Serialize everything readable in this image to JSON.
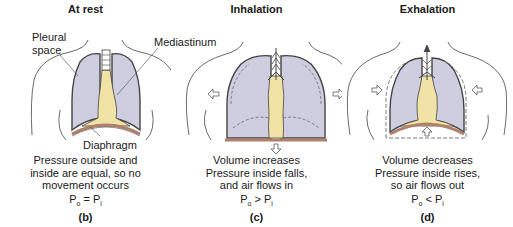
{
  "panels": [
    {
      "title": "At rest",
      "labels": {
        "pleural": "Pleural\nspace",
        "mediastinum": "Mediastinum",
        "diaphragm": "Diaphragm"
      },
      "caption": [
        "Pressure outside and",
        "inside are equal, so no",
        "movement occurs"
      ],
      "equation": {
        "left": "P",
        "left_sub": "o",
        "op": " = ",
        "right": "P",
        "right_sub": "i"
      },
      "letter": "(b)"
    },
    {
      "title": "Inhalation",
      "caption": [
        "Volume increases",
        "Pressure inside falls,",
        "and air flows in"
      ],
      "equation": {
        "left": "P",
        "left_sub": "o",
        "op": " > ",
        "right": "P",
        "right_sub": "i"
      },
      "letter": "(c)"
    },
    {
      "title": "Exhalation",
      "caption": [
        "Volume decreases",
        "Pressure inside rises,",
        "so air flows out"
      ],
      "equation": {
        "left": "P",
        "left_sub": "o",
        "op": " < ",
        "right": "P",
        "right_sub": "i"
      },
      "letter": "(d)"
    }
  ],
  "colors": {
    "lung": "#cfcde0",
    "mediastinum": "#f1e3a6",
    "diaphragm": "#b0806a",
    "outline": "#333333"
  }
}
